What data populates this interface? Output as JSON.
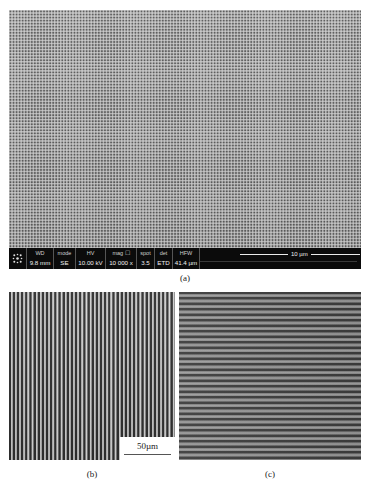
{
  "figure": {
    "panel_a": {
      "caption": "(a)",
      "description": "SEM image of periodic dot array",
      "info_bar": {
        "cells": [
          {
            "label": "WD",
            "value": "9.8 mm"
          },
          {
            "label": "mode",
            "value": "SE"
          },
          {
            "label": "HV",
            "value": "10.00 kV"
          },
          {
            "label": "mag ☐",
            "value": "10 000 x"
          },
          {
            "label": "spot",
            "value": "3.5"
          },
          {
            "label": "det",
            "value": "ETD"
          },
          {
            "label": "HFW",
            "value": "41.4 µm"
          }
        ],
        "scale_bar": "10 µm",
        "logo_icon": "fei-logo-icon"
      }
    },
    "panel_b": {
      "caption": "(b)",
      "description": "Vertical grating lines",
      "scale_bar": "50µm"
    },
    "panel_c": {
      "caption": "(c)",
      "description": "Horizontal grating lines"
    }
  }
}
